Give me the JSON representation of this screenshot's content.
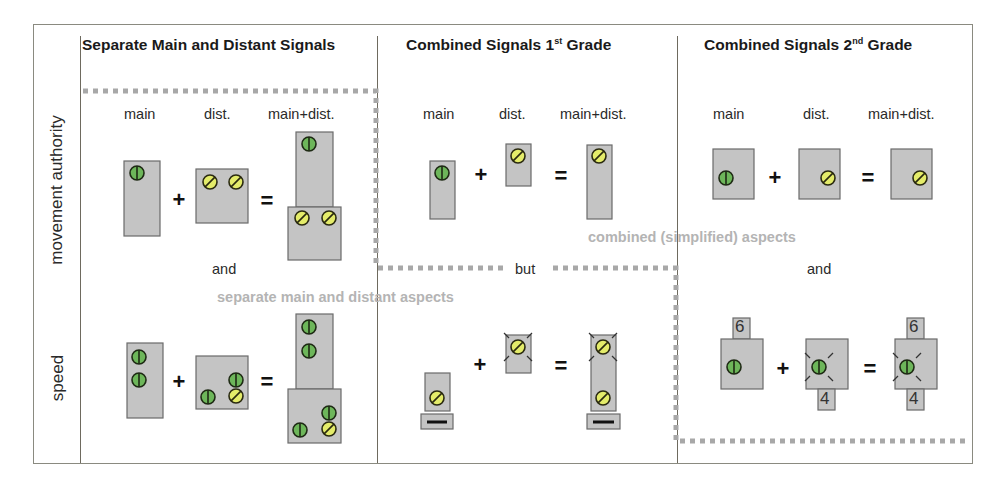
{
  "columns": [
    {
      "title": "Separate Main and Distant Signals",
      "sup": ""
    },
    {
      "title_pre": "Combined Signals 1",
      "sup": "st",
      "title_post": " Grade"
    },
    {
      "title_pre": "Combined Signals 2",
      "sup": "nd",
      "title_post": " Grade"
    }
  ],
  "rows": [
    {
      "label": "movement authority"
    },
    {
      "label": "speed"
    }
  ],
  "signal_labels": {
    "main": "main",
    "dist": "dist.",
    "combined": "main+dist."
  },
  "connectors": {
    "and_1": "and",
    "but": "but",
    "and_3": "and"
  },
  "group_labels": {
    "separate": "separate main and distant aspects",
    "combined": "combined (simplified) aspects"
  },
  "speed_indicators": {
    "main": "6",
    "dist": "4",
    "combined_top": "6",
    "combined_bottom": "4"
  },
  "colors": {
    "signal_body": "#c4c4c4",
    "green_lamp": "#6db65a",
    "yellow_lamp": "#e4ec6a",
    "dotted_border": "#a8a8a8",
    "group_label": "#b4b4b4"
  }
}
